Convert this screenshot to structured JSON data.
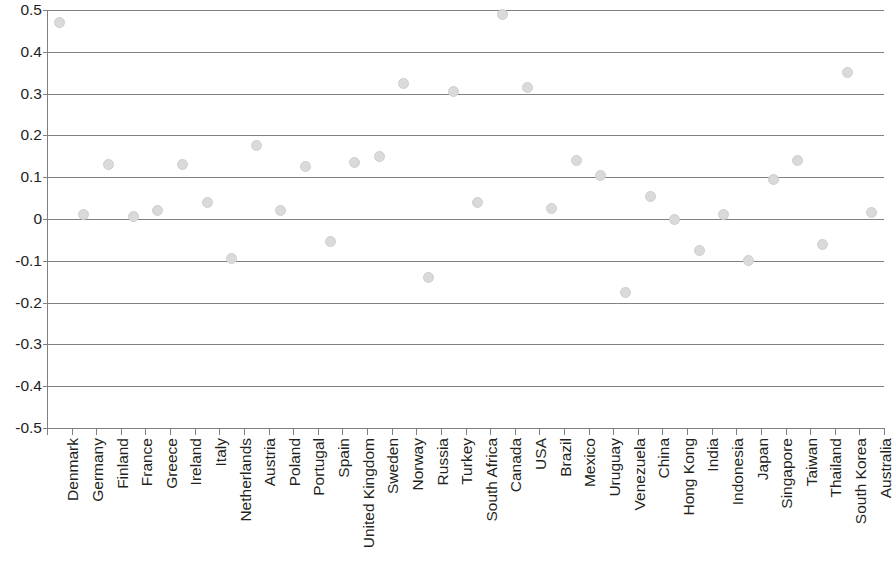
{
  "chart_data": {
    "type": "scatter",
    "title": "",
    "subtitle": "",
    "xlabel": "",
    "ylabel": "",
    "ylim": [
      -0.5,
      0.5
    ],
    "y_ticks": [
      "0.5",
      "0.4",
      "0.3",
      "0.2",
      "0.1",
      "0",
      "-0.1",
      "-0.2",
      "-0.3",
      "-0.4",
      "-0.5"
    ],
    "y_tick_values": [
      0.5,
      0.4,
      0.3,
      0.2,
      0.1,
      0,
      -0.1,
      -0.2,
      -0.3,
      -0.4,
      -0.5
    ],
    "grid": true,
    "legend": "none",
    "marker_color": "#dadada",
    "axis_color": "#808080",
    "text_color": "#231f20",
    "categories": [
      "Denmark",
      "Germany",
      "Finland",
      "France",
      "Greece",
      "Ireland",
      "Italy",
      "Netherlands",
      "Austria",
      "Poland",
      "Portugal",
      "Spain",
      "United Kingdom",
      "Sweden",
      "Norway",
      "Russia",
      "Turkey",
      "South Africa",
      "Canada",
      "USA",
      "Brazil",
      "Mexico",
      "Uruguay",
      "Venezuela",
      "China",
      "Hong Kong",
      "India",
      "Indonesia",
      "Japan",
      "Singapore",
      "Taiwan",
      "Thailand",
      "South Korea",
      "Australia"
    ],
    "values": [
      0.47,
      0.01,
      0.13,
      0.005,
      0.02,
      0.13,
      0.04,
      -0.095,
      0.175,
      0.02,
      0.125,
      -0.055,
      0.135,
      0.15,
      0.325,
      -0.14,
      0.305,
      0.04,
      0.49,
      0.315,
      0.025,
      0.14,
      0.105,
      -0.175,
      0.055,
      0.0,
      -0.075,
      0.01,
      -0.1,
      0.095,
      0.14,
      -0.06,
      0.35,
      0.015
    ]
  }
}
